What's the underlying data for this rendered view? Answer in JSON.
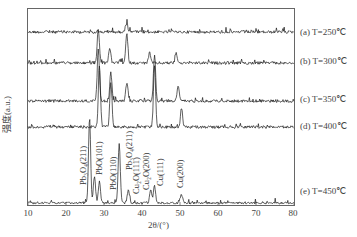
{
  "chart_data": {
    "type": "line",
    "title": "",
    "xlabel": "2θ/(°)",
    "ylabel": "强度(a.u.)",
    "xlim": [
      10,
      80
    ],
    "xticks": [
      10,
      20,
      30,
      40,
      50,
      60,
      70,
      80
    ],
    "grid": false,
    "legend_position": "right, inline labels per trace",
    "series": [
      {
        "name": "(a) T=250℃",
        "label": "(a) T=250℃",
        "peaks": [
          {
            "x": 36.0,
            "rel_height": 0.5
          }
        ],
        "noise": 0.35
      },
      {
        "name": "(b) T=300℃",
        "label": "(b) T=300℃",
        "peaks": [
          {
            "x": 28.5,
            "rel_height": 1.0
          },
          {
            "x": 31.5,
            "rel_height": 0.45
          },
          {
            "x": 36.0,
            "rel_height": 0.85
          },
          {
            "x": 42.0,
            "rel_height": 0.3
          },
          {
            "x": 49.0,
            "rel_height": 0.3
          }
        ],
        "noise": 0.35
      },
      {
        "name": "(c) T=350℃",
        "label": "(c) T=350℃",
        "peaks": [
          {
            "x": 28.5,
            "rel_height": 1.0
          },
          {
            "x": 31.8,
            "rel_height": 0.55
          },
          {
            "x": 36.0,
            "rel_height": 0.35
          },
          {
            "x": 43.3,
            "rel_height": 0.9
          },
          {
            "x": 49.5,
            "rel_height": 0.3
          }
        ],
        "noise": 0.35
      },
      {
        "name": "(d) T=400℃",
        "label": "(d) T=400℃",
        "peaks": [
          {
            "x": 28.8,
            "rel_height": 1.0
          },
          {
            "x": 31.8,
            "rel_height": 0.7
          },
          {
            "x": 43.3,
            "rel_height": 1.0
          },
          {
            "x": 50.4,
            "rel_height": 0.3
          }
        ],
        "noise": 0.35
      },
      {
        "name": "(e) T=450℃",
        "label": "(e) T=450℃",
        "peaks": [
          {
            "x": 26.2,
            "rel_height": 1.0
          },
          {
            "x": 27.5,
            "rel_height": 0.3
          },
          {
            "x": 28.8,
            "rel_height": 0.25
          },
          {
            "x": 34.0,
            "rel_height": 0.7
          },
          {
            "x": 36.4,
            "rel_height": 0.15
          },
          {
            "x": 42.3,
            "rel_height": 0.15
          },
          {
            "x": 43.3,
            "rel_height": 0.2
          },
          {
            "x": 50.4,
            "rel_height": 0.1
          }
        ],
        "noise": 0.25
      }
    ],
    "annotations": [
      {
        "text": "Pb₃O₄(211)",
        "x": 26.2
      },
      {
        "text": "PbO(101)",
        "x": 28.4
      },
      {
        "text": "PbO(110)",
        "x": 31.4
      },
      {
        "text": "Pb₃O₄(211)",
        "x": 34.4
      },
      {
        "text": "Cu₂O(111)",
        "x": 36.4
      },
      {
        "text": "Cu₂O(200)",
        "x": 42.3
      },
      {
        "text": "Cu(111)",
        "x": 43.3
      },
      {
        "text": "Cu(200)",
        "x": 50.4
      }
    ]
  },
  "labels": {
    "a": "(a) T=250℃",
    "b": "(b) T=300℃",
    "c": "(c) T=350℃",
    "d": "(d) T=400℃",
    "e": "(e) T=450℃"
  },
  "axis": {
    "xlabel": "2θ/(°)",
    "ylabel": "强度(a.u.)",
    "ticks": [
      "10",
      "20",
      "30",
      "40",
      "50",
      "60",
      "70",
      "80"
    ]
  },
  "annotations": {
    "a1": "Pb₃O₄(211)",
    "a2": "PbO(101)",
    "a3": "PbO(110)",
    "a4": "Pb₃O₄(211)",
    "a5": "Cu₂O(111)",
    "a6": "Cu₂O(200)",
    "a7": "Cu(111)",
    "a8": "Cu(200)"
  },
  "colors": {
    "line": "#1a1a1a",
    "frame": "#555555"
  }
}
